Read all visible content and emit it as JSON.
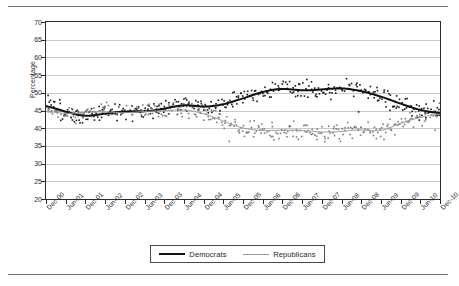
{
  "chart_data": {
    "type": "scatter",
    "title": "",
    "subtitle": "",
    "xlabel": "",
    "ylabel": "Percentage",
    "ylim": [
      20,
      70
    ],
    "ytick_step": 5,
    "yticks": [
      70,
      65,
      60,
      55,
      50,
      45,
      40,
      35,
      30,
      25,
      20
    ],
    "grid": "horizontal",
    "legend_position": "bottom",
    "categories": [
      "Dec-00",
      "Jun-01",
      "Dec-01",
      "Jun-02",
      "Dec-02",
      "Jun-03",
      "Dec-03",
      "Jun-04",
      "Dec-04",
      "Jun-05",
      "Dec-05",
      "Jun-06",
      "Dec-06",
      "Jun-07",
      "Dec-07",
      "Jun-08",
      "Dec-08",
      "Jun-09",
      "Dec-09",
      "Jun-10",
      "Dec-10"
    ],
    "series": [
      {
        "name": "Democrats",
        "style": "smoothed-trend-line",
        "color": "#111111",
        "width": 2,
        "values": [
          46.6,
          44.6,
          43.1,
          44.2,
          44.8,
          44.6,
          45.4,
          46.9,
          45.8,
          46.6,
          48.4,
          50.4,
          51.4,
          50.5,
          50.9,
          51.5,
          50.6,
          49.0,
          46.9,
          45.0,
          44.1
        ]
      },
      {
        "name": "Republicans",
        "style": "smoothed-trend-line",
        "color": "#9a9a9a",
        "width": 1,
        "values": [
          45.0,
          43.9,
          44.6,
          44.7,
          44.2,
          44.8,
          44.9,
          45.4,
          44.3,
          42.0,
          39.8,
          39.2,
          39.5,
          39.4,
          38.8,
          39.0,
          39.8,
          38.7,
          41.6,
          43.1,
          44.2
        ]
      }
    ],
    "scatter": {
      "marker": "square",
      "marker_size": 1.6,
      "note": "Dense individual poll observations plotted behind each smoothed trend line.",
      "democrats_spread": [
        41,
        56
      ],
      "republicans_spread": [
        33,
        50
      ]
    },
    "annotations": []
  },
  "legend": {
    "items": [
      {
        "label": "Democrats",
        "swatch": "thick-black-line"
      },
      {
        "label": "Republicans",
        "swatch": "thin-gray-line"
      }
    ]
  }
}
